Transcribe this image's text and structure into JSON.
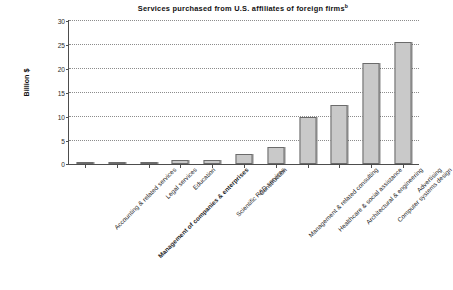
{
  "chart_data": {
    "type": "bar",
    "title": "Services purchased from U.S. affiliates of foreign firms",
    "title_superscript": "b",
    "xlabel": "",
    "ylabel": "Billion $",
    "ylim": [
      0,
      30
    ],
    "ytick_step": 5,
    "yticks": [
      0,
      5,
      10,
      15,
      20,
      25,
      30
    ],
    "ytick_labels": [
      "0",
      "5",
      "10",
      "15",
      "20",
      "25",
      "30"
    ],
    "grid": true,
    "grid_axis": "y",
    "legend": false,
    "categories": [
      "Accounting & related services",
      "Management of companies & enterprises",
      "Legal services",
      "Education",
      "Scientific R&D services",
      "Construction",
      "Management & related consulting",
      "Healthcare & social assistance",
      "Architectural & engineering",
      "Computer systems design",
      "Advertising"
    ],
    "values": [
      0.15,
      0.15,
      0.15,
      0.9,
      0.9,
      2.0,
      3.5,
      9.8,
      12.3,
      21.0,
      25.5
    ],
    "bar_fill_color": "#c9c9c9",
    "bar_border_color": "#6b6b6b",
    "grid_color": "#8c8c8c",
    "axis_color": "#4d4d4d",
    "background_color": "#ffffff"
  }
}
